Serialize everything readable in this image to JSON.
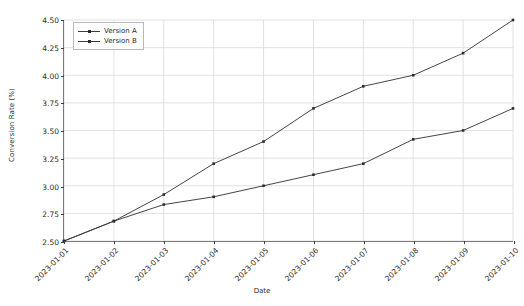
{
  "chart_data": {
    "type": "line",
    "title": "",
    "xlabel": "Date",
    "ylabel": "Conversion Rate (%)",
    "categories": [
      "2023-01-01",
      "2023-01-02",
      "2023-01-03",
      "2023-01-04",
      "2023-01-05",
      "2023-01-06",
      "2023-01-07",
      "2023-01-08",
      "2023-01-09",
      "2023-01-10"
    ],
    "series": [
      {
        "name": "Version A",
        "color": "#3a3a3a",
        "marker": "square",
        "values": [
          2.5,
          2.68,
          2.83,
          2.9,
          3.0,
          3.1,
          3.2,
          3.42,
          3.5,
          3.7
        ]
      },
      {
        "name": "Version B",
        "color": "#3a3a3a",
        "marker": "square",
        "values": [
          2.5,
          2.68,
          2.92,
          3.2,
          3.4,
          3.7,
          3.9,
          4.0,
          4.2,
          4.5
        ]
      }
    ],
    "ylim": [
      2.5,
      4.5
    ],
    "yticks": [
      2.5,
      2.75,
      3.0,
      3.25,
      3.5,
      3.75,
      4.0,
      4.25,
      4.5
    ],
    "ytick_labels": [
      "2.50",
      "2.75",
      "3.00",
      "3.25",
      "3.50",
      "3.75",
      "4.00",
      "4.25",
      "4.50"
    ],
    "grid": true,
    "grid_color": "#d9d9d9",
    "legend_position": "upper left",
    "xtick_rotation": -45,
    "background": "#ffffff"
  }
}
